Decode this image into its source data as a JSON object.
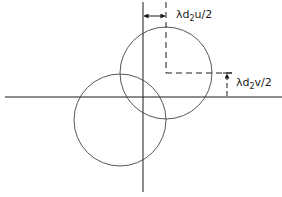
{
  "diagram": {
    "labels": {
      "horizontal_offset": {
        "base": "λd",
        "sub": "2",
        "rest": "u/2"
      },
      "vertical_offset": {
        "base": "λd",
        "sub": "2",
        "rest": "v/2"
      }
    },
    "colors": {
      "line": "#1a1a1a",
      "circle": "#444444",
      "background": "#ffffff"
    },
    "elements": {
      "axes": "two perpendicular solid axes crossing at origin",
      "circles": [
        "upper-right circle (shifted)",
        "lower-left circle (reference)"
      ],
      "offset_guides": [
        "dashed vertical + horizontal lines marking shifted circle center"
      ]
    }
  }
}
